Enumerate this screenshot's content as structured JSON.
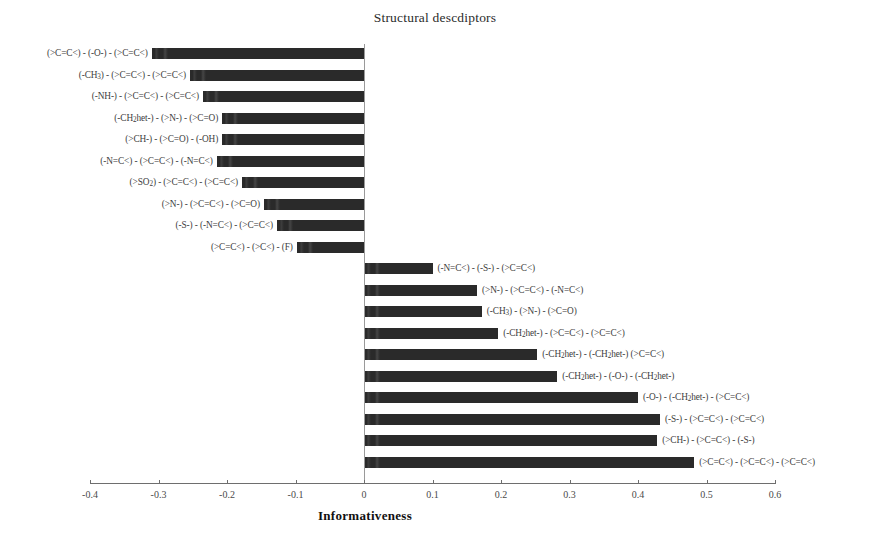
{
  "chart_data": {
    "type": "bar",
    "orientation": "horizontal",
    "title": "Structural descdiptors",
    "xlabel": "Informativeness",
    "ylabel": "",
    "xlim": [
      -0.4,
      0.6
    ],
    "xticks": [
      -0.4,
      -0.3,
      -0.2,
      -0.1,
      0,
      0.1,
      0.2,
      0.3,
      0.4,
      0.5,
      0.6
    ],
    "xticklabels": [
      "-0.4",
      "-0.3",
      "-0.2",
      "-0.1",
      "0",
      "0.1",
      "0.2",
      "0.3",
      "0.4",
      "0.5",
      "0.6"
    ],
    "grid": false,
    "legend": null,
    "bar_color": "#2a2a2a",
    "zero_line_color": "#9a9a9a",
    "axis_color": "#6e6e6e",
    "categories": [
      "(>C=C<) - (-O-) - (>C=C<)",
      "(-CH3) - (>C=C<) - (>C=C<)",
      "(-NH-) - (>C=C<) - (>C=C<)",
      "(-CH2het-) - (>N-) - (>C=O)",
      "(>CH-) - (>C=O) - (-OH)",
      "(-N=C<) - (>C=C<) - (-N=C<)",
      "(>SO2) - (>C=C<) - (>C=C<)",
      "(>N-) - (>C=C<) - (>C=O)",
      "(-S-) - (-N=C<) - (>C=C<)",
      "(>C=C<) - (>C<) - (F)",
      "(-N=C<) - (-S-) - (>C=C<)",
      "(>N-) - (>C=C<) - (-N=C<)",
      "(-CH3) - (>N-) - (>C=O)",
      "(-CH2het-) - (>C=C<) - (>C=C<)",
      "(-CH2het-) - (-CH2het-) (>C=C<)",
      "(-CH2het-) - (-O-) - (-CH2het-)",
      "(-O-) - (-CH2het-) - (>C=C<)",
      "(-S-) - (>C=C<) - (>C=C<)",
      "(>CH-) - (>C=C<) - (-S-)",
      "(>C=C<) - (>C=C<) - (>C=C<)"
    ],
    "values": [
      -0.31,
      -0.254,
      -0.235,
      -0.207,
      -0.207,
      -0.215,
      -0.178,
      -0.146,
      -0.127,
      -0.098,
      0.1,
      0.165,
      0.172,
      0.196,
      0.253,
      0.282,
      0.4,
      0.432,
      0.428,
      0.482
    ],
    "bars": [
      {
        "label": "(>C=C<) - (-O-) - (>C=C<)",
        "value": -0.31,
        "sign": "negative"
      },
      {
        "label": "(-CH3) - (>C=C<) - (>C=C<)",
        "value": -0.254,
        "sign": "negative"
      },
      {
        "label": "(-NH-) - (>C=C<) - (>C=C<)",
        "value": -0.235,
        "sign": "negative"
      },
      {
        "label": "(-CH2het-) - (>N-) - (>C=O)",
        "value": -0.207,
        "sign": "negative"
      },
      {
        "label": "(>CH-) - (>C=O) - (-OH)",
        "value": -0.207,
        "sign": "negative"
      },
      {
        "label": "(-N=C<) - (>C=C<) - (-N=C<)",
        "value": -0.215,
        "sign": "negative"
      },
      {
        "label": "(>SO2) - (>C=C<) - (>C=C<)",
        "value": -0.178,
        "sign": "negative"
      },
      {
        "label": "(>N-) - (>C=C<) - (>C=O)",
        "value": -0.146,
        "sign": "negative"
      },
      {
        "label": "(-S-) - (-N=C<) - (>C=C<)",
        "value": -0.127,
        "sign": "negative"
      },
      {
        "label": "(>C=C<) - (>C<) - (F)",
        "value": -0.098,
        "sign": "negative"
      },
      {
        "label": "(-N=C<) - (-S-) - (>C=C<)",
        "value": 0.1,
        "sign": "positive"
      },
      {
        "label": "(>N-) - (>C=C<) - (-N=C<)",
        "value": 0.165,
        "sign": "positive"
      },
      {
        "label": "(-CH3) - (>N-) - (>C=O)",
        "value": 0.172,
        "sign": "positive"
      },
      {
        "label": "(-CH2het-) - (>C=C<) - (>C=C<)",
        "value": 0.196,
        "sign": "positive"
      },
      {
        "label": "(-CH2het-) - (-CH2het-) (>C=C<)",
        "value": 0.253,
        "sign": "positive"
      },
      {
        "label": "(-CH2het-) - (-O-) - (-CH2het-)",
        "value": 0.282,
        "sign": "positive"
      },
      {
        "label": "(-O-) - (-CH2het-) - (>C=C<)",
        "value": 0.4,
        "sign": "positive"
      },
      {
        "label": "(-S-) - (>C=C<) - (>C=C<)",
        "value": 0.432,
        "sign": "positive"
      },
      {
        "label": "(>CH-) - (>C=C<) - (-S-)",
        "value": 0.428,
        "sign": "positive"
      },
      {
        "label": "(>C=C<) - (>C=C<) - (>C=C<)",
        "value": 0.482,
        "sign": "positive"
      }
    ]
  }
}
